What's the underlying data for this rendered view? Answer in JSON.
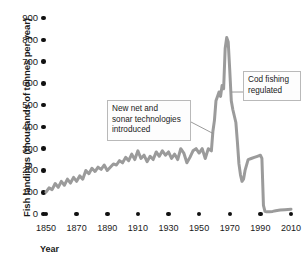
{
  "chart_data": {
    "type": "line",
    "title": "",
    "xlabel": "Year",
    "ylabel": "Fish landings (thousands of tonnes per year)",
    "xlim": [
      1850,
      2010
    ],
    "ylim": [
      0,
      900
    ],
    "xticks": [
      1850,
      1870,
      1890,
      1910,
      1930,
      1950,
      1970,
      1990,
      2010
    ],
    "yticks": [
      0,
      100,
      200,
      300,
      400,
      500,
      600,
      700,
      800,
      900
    ],
    "grid": false,
    "legend": "none",
    "series": [
      {
        "name": "Fish landings",
        "color": "#9b9b9b",
        "x": [
          1850,
          1852,
          1854,
          1856,
          1858,
          1860,
          1862,
          1864,
          1866,
          1868,
          1870,
          1872,
          1874,
          1876,
          1878,
          1880,
          1882,
          1884,
          1886,
          1888,
          1890,
          1892,
          1894,
          1896,
          1898,
          1900,
          1902,
          1904,
          1906,
          1908,
          1910,
          1912,
          1914,
          1916,
          1918,
          1920,
          1922,
          1924,
          1926,
          1928,
          1930,
          1932,
          1934,
          1936,
          1938,
          1940,
          1942,
          1944,
          1946,
          1948,
          1950,
          1952,
          1954,
          1956,
          1958,
          1959,
          1960,
          1961,
          1962,
          1963,
          1964,
          1965,
          1966,
          1967,
          1968,
          1969,
          1970,
          1971,
          1972,
          1973,
          1974,
          1975,
          1976,
          1977,
          1978,
          1979,
          1980,
          1982,
          1984,
          1986,
          1988,
          1990,
          1991,
          1992,
          1993,
          1994,
          1996,
          1998,
          2000,
          2003,
          2006,
          2010
        ],
        "y": [
          100,
          120,
          112,
          140,
          122,
          150,
          132,
          160,
          142,
          168,
          150,
          175,
          160,
          200,
          185,
          210,
          195,
          215,
          205,
          225,
          200,
          215,
          230,
          225,
          245,
          235,
          260,
          245,
          275,
          250,
          290,
          255,
          270,
          240,
          265,
          250,
          285,
          265,
          290,
          270,
          285,
          255,
          275,
          250,
          300,
          280,
          235,
          260,
          290,
          300,
          280,
          300,
          255,
          300,
          290,
          380,
          430,
          520,
          540,
          560,
          540,
          590,
          575,
          760,
          810,
          790,
          660,
          520,
          480,
          450,
          420,
          330,
          230,
          180,
          150,
          160,
          200,
          250,
          255,
          260,
          265,
          270,
          255,
          40,
          12,
          10,
          10,
          12,
          15,
          18,
          20,
          22
        ]
      }
    ],
    "annotations": [
      {
        "id": "tech",
        "text": "New net and\nsonar technologies\nintroduced",
        "target_year": 1959,
        "target_value": 370
      },
      {
        "id": "cod",
        "text": "Cod fishing\nregulated",
        "target_year": 1969,
        "target_value": 560
      }
    ]
  }
}
